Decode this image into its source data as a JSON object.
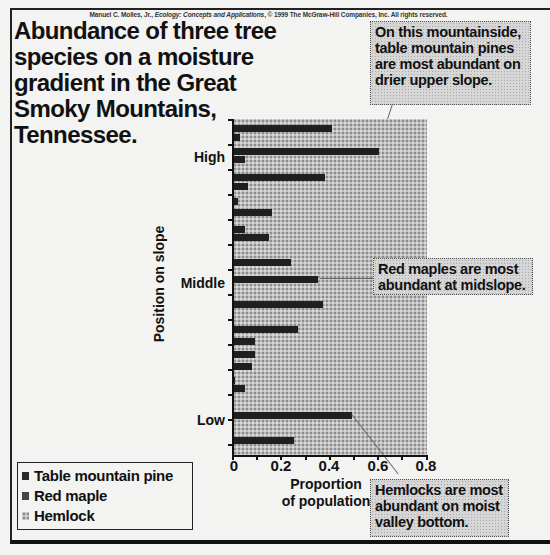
{
  "credit": {
    "author": "Manuel C. Molles, Jr., ",
    "book": "Ecology: Concepts and Applications",
    "rest": ", © 1999 The McGraw-Hill Companies, Inc. All rights reserved."
  },
  "title": "Abundance of three tree species on a moisture gradient in the Great Smoky Mountains, Tennessee.",
  "annotations": {
    "top": "On this mountainside, table mountain pines are most abundant on drier upper slope.",
    "middle": "Red maples are most abundant at midslope.",
    "bottom": "Hemlocks are most abundant on moist valley bottom."
  },
  "legend": {
    "items": [
      {
        "label": "Table mountain pine",
        "color": "#2a2a2a"
      },
      {
        "label": "Red maple",
        "color": "#444444"
      },
      {
        "label": "Hemlock",
        "color": "#a8a8a8"
      }
    ]
  },
  "axes": {
    "ylabel": "Position on slope",
    "xlabel_line1": "Proportion",
    "xlabel_line2": "of population",
    "y_categories": {
      "high": "High",
      "middle": "Middle",
      "low": "Low"
    },
    "x_ticks": [
      "0",
      "0.2",
      "0.4",
      "0.6",
      "0.8"
    ]
  },
  "chart_data": {
    "type": "bar",
    "orientation": "horizontal",
    "title": "Abundance of three tree species on a moisture gradient in the Great Smoky Mountains, Tennessee.",
    "xlabel": "Proportion of population",
    "ylabel": "Position on slope",
    "xlim": [
      0,
      0.8
    ],
    "x_ticks": [
      0,
      0.2,
      0.4,
      0.6,
      0.8
    ],
    "y_tick_labels": [
      "High",
      "Middle",
      "Low"
    ],
    "legend_position": "bottom-left",
    "series": [
      {
        "name": "Table mountain pine (and red maple, dark bars, top to bottom)",
        "values": [
          0.41,
          0.03,
          0.6,
          0.05,
          0.38,
          0.06,
          0.02,
          0.16,
          0.05,
          0.15,
          0.24,
          0.35,
          0.37,
          0.27,
          0.09,
          0.09,
          0.08,
          0.01,
          0.05,
          0.0,
          0.49,
          0.25
        ]
      },
      {
        "name": "Hemlock (stippled background region)",
        "values": [
          0.8
        ]
      }
    ],
    "bars_px": [
      {
        "y": 128,
        "v": 0.41
      },
      {
        "y": 137,
        "v": 0.03
      },
      {
        "y": 151,
        "v": 0.6
      },
      {
        "y": 159,
        "v": 0.05
      },
      {
        "y": 177,
        "v": 0.38
      },
      {
        "y": 186,
        "v": 0.06
      },
      {
        "y": 201,
        "v": 0.02
      },
      {
        "y": 212,
        "v": 0.16
      },
      {
        "y": 229,
        "v": 0.05
      },
      {
        "y": 237,
        "v": 0.15
      },
      {
        "y": 262,
        "v": 0.24
      },
      {
        "y": 279,
        "v": 0.35
      },
      {
        "y": 304,
        "v": 0.37
      },
      {
        "y": 329,
        "v": 0.27
      },
      {
        "y": 341,
        "v": 0.09
      },
      {
        "y": 354,
        "v": 0.09
      },
      {
        "y": 366,
        "v": 0.08
      },
      {
        "y": 380,
        "v": 0.01
      },
      {
        "y": 388,
        "v": 0.05
      },
      {
        "y": 415,
        "v": 0.49
      },
      {
        "y": 440,
        "v": 0.25
      }
    ],
    "annotations": [
      "On this mountainside, table mountain pines are most abundant on drier upper slope.",
      "Red maples are most abundant at midslope.",
      "Hemlocks are most abundant on moist valley bottom."
    ]
  }
}
